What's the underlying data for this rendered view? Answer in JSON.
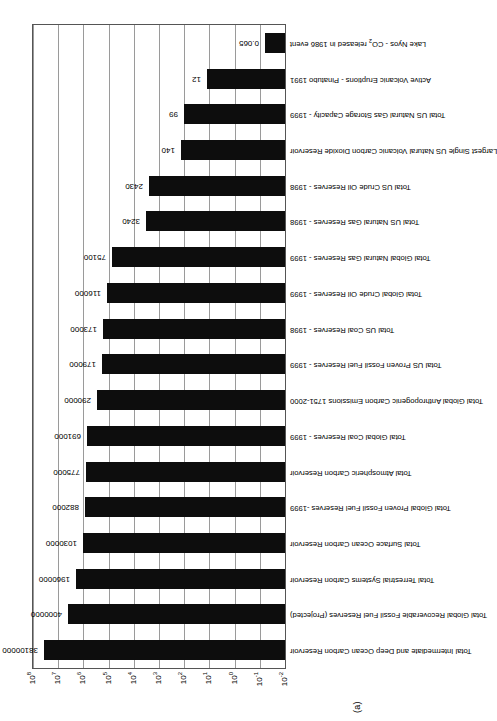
{
  "figure": {
    "subfigure_label": "(a)",
    "axis_color": "#555555",
    "grid_color": "#9a9a9a",
    "bar_color": "#0d0d0d",
    "background": "#ffffff"
  },
  "chart_data": {
    "type": "bar",
    "title": "",
    "subtitle": "",
    "xlabel": "",
    "ylabel": "",
    "yscale": "log",
    "ylim": [
      0.01,
      100000000
    ],
    "grid": true,
    "legend": null,
    "annotations": [
      "(a)"
    ],
    "ytick_labels": [
      "10⁻²",
      "10⁻¹",
      "10⁰",
      "10¹",
      "10²",
      "10³",
      "10⁴",
      "10⁵",
      "10⁶",
      "10⁷",
      "10⁸"
    ],
    "ytick_values": [
      0.01,
      0.1,
      1,
      10,
      100,
      1000,
      10000,
      100000,
      1000000,
      10000000,
      100000000
    ],
    "ytick_bases": [
      -2,
      -1,
      0,
      1,
      2,
      3,
      4,
      5,
      6,
      7,
      8
    ],
    "categories": [
      "Total Intermediate and Deep Ocean Carbon Reservoir",
      "Total Global Recoverable Fossil Fuel Reserves (Projected)",
      "Total Terrestrial Systems Carbon Reservoir",
      "Total Surface Ocean Carbon Reservoir",
      "Total Global Proven Fossil Fuel Reserves -1999",
      "Total Atmospheric Carbon Reservoir",
      "Total Global Coal Reserves - 1999",
      "Total Global Anthropogenic Carbon Emissions 1751-2000",
      "Total US Proven Fossil Fuel Reserves - 1999",
      "Total US Coal Reserves - 1998",
      "Total Global Crude Oil Reserves - 1999",
      "Total Global Natural Gas Reserves - 1999",
      "Total US Natural Gas Reserves - 1998",
      "Total US Crude Oil Reserves - 1998",
      "Largest Single US Natural Volcanic Carbon Dioxide Reservoir",
      "Total US Natural Gas Storage Capacity - 1999",
      "Active Volcanic Eruptions - Pinatubo 1991",
      "Lake Nyos - CO@SUB2@ released in 1986 event"
    ],
    "values": [
      38100000,
      4000000,
      1960000,
      1030000,
      882000,
      775000,
      691000,
      290000,
      179000,
      173000,
      116000,
      75100,
      3240,
      2430,
      140,
      99,
      12,
      0.065
    ],
    "value_labels": [
      "38100000",
      "4000000",
      "1960000",
      "1030000",
      "882000",
      "775000",
      "691000",
      "290000",
      "179000",
      "173000",
      "116000",
      "75100",
      "3240",
      "2430",
      "140",
      "99",
      "12",
      "0.065"
    ]
  }
}
